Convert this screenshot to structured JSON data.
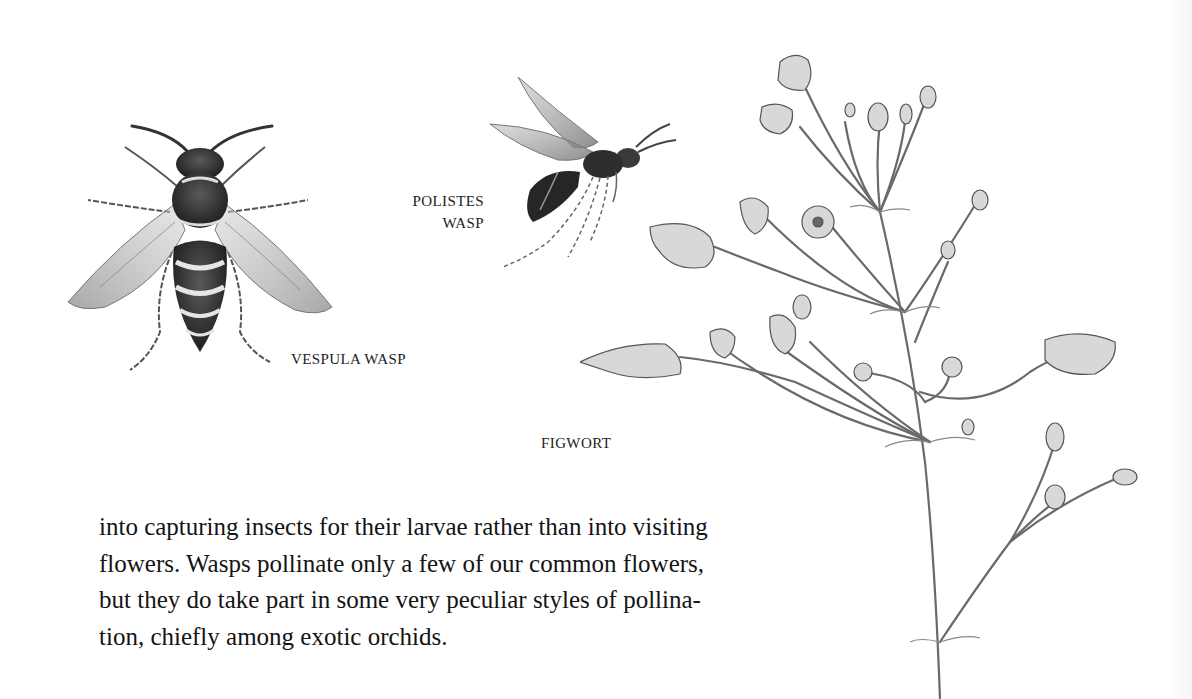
{
  "page": {
    "background": "#ffffff",
    "ink_color": "#1a1a1a"
  },
  "illustrations": {
    "vespula": {
      "caption": "VESPULA WASP",
      "icon": "vespula-wasp-illustration"
    },
    "polistes": {
      "caption_line1": "POLISTES",
      "caption_line2": "WASP",
      "icon": "polistes-wasp-illustration"
    },
    "figwort": {
      "caption": "FIGWORT",
      "icon": "figwort-plant-illustration"
    }
  },
  "body": {
    "lines": [
      "into capturing insects for their larvae rather than into visiting",
      "flowers. Wasps pollinate only a few of our common flowers,",
      "but they do take part in some very peculiar styles of pollina-",
      "tion, chiefly among exotic orchids."
    ]
  }
}
